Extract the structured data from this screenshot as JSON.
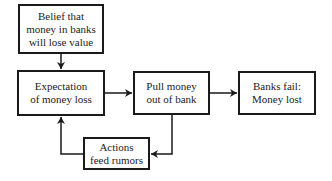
{
  "diagram": {
    "type": "flowchart",
    "nodes": [
      {
        "id": "belief",
        "label": "Belief that money in banks will lose value"
      },
      {
        "id": "expectation",
        "label": "Expectation of money loss"
      },
      {
        "id": "pull",
        "label": "Pull money out of bank"
      },
      {
        "id": "fail",
        "label": "Banks fail: Money lost"
      },
      {
        "id": "actions",
        "label": "Actions feed rumors"
      }
    ],
    "edges": [
      {
        "from": "belief",
        "to": "expectation"
      },
      {
        "from": "expectation",
        "to": "pull"
      },
      {
        "from": "pull",
        "to": "fail"
      },
      {
        "from": "pull",
        "to": "actions"
      },
      {
        "from": "actions",
        "to": "expectation"
      }
    ],
    "colors": {
      "stroke": "#1a1a1a",
      "text": "#222222",
      "background": "#ffffff"
    }
  }
}
